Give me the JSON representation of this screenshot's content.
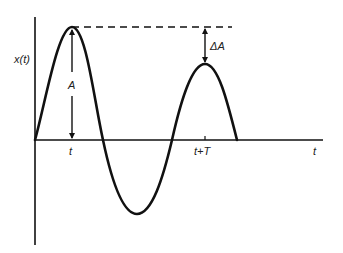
{
  "diagram": {
    "type": "damped-oscillation-waveform",
    "labels": {
      "y_axis": "x(t)",
      "x_axis": "t",
      "amplitude": "A",
      "amplitude_decrease": "ΔA",
      "tick_first_peak": "t",
      "tick_second_peak": "t+T"
    },
    "colors": {
      "stroke": "#111111",
      "background": "#ffffff"
    }
  }
}
